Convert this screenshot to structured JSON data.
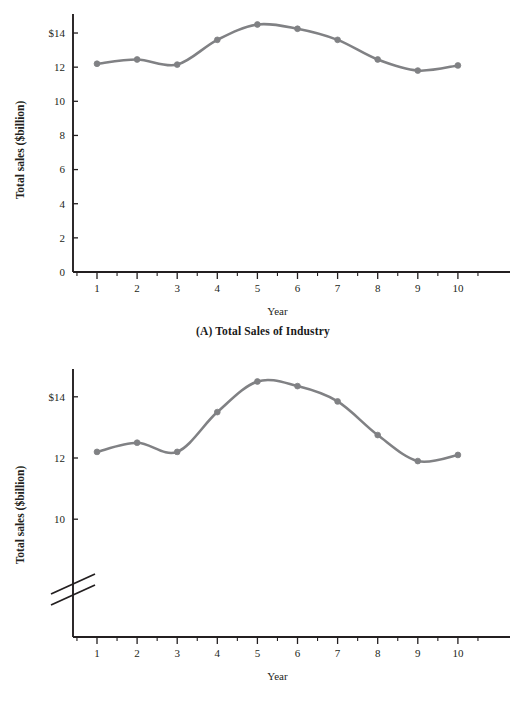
{
  "chart_data": [
    {
      "id": "panel-a",
      "type": "line",
      "title": "(A) Total Sales of Industry",
      "xlabel": "Year",
      "ylabel": "Total sales ($billion)",
      "x": [
        1,
        2,
        3,
        4,
        5,
        6,
        7,
        8,
        9,
        10
      ],
      "categories": [
        "1",
        "2",
        "3",
        "4",
        "5",
        "6",
        "7",
        "8",
        "9",
        "10"
      ],
      "values": [
        12.2,
        12.45,
        12.15,
        13.6,
        14.5,
        14.25,
        13.6,
        12.45,
        11.8,
        12.1
      ],
      "series": [
        {
          "name": "Total sales",
          "values": [
            12.2,
            12.45,
            12.15,
            13.6,
            14.5,
            14.25,
            13.6,
            12.45,
            11.8,
            12.1
          ]
        }
      ],
      "xlim": [
        0,
        11
      ],
      "ylim": [
        0,
        15.1
      ],
      "ytick_values": [
        0,
        2,
        4,
        6,
        8,
        10,
        12,
        14
      ],
      "ytick_labels": [
        "0",
        "2",
        "4",
        "6",
        "8",
        "10",
        "12",
        "$14"
      ],
      "xtick_values": [
        1,
        2,
        3,
        4,
        5,
        6,
        7,
        8,
        9,
        10
      ],
      "xtick_labels": [
        "1",
        "2",
        "3",
        "4",
        "5",
        "6",
        "7",
        "8",
        "9",
        "10"
      ],
      "minor_xticks": true,
      "grid": false,
      "legend": "none",
      "truncated_axis": false,
      "line_color": "#808184",
      "marker": "circle"
    },
    {
      "id": "panel-b",
      "type": "line",
      "title": "(B) Truncated Vertical Axis",
      "xlabel": "Year",
      "ylabel": "Total sales ($billion)",
      "x": [
        1,
        2,
        3,
        4,
        5,
        6,
        7,
        8,
        9,
        10
      ],
      "categories": [
        "1",
        "2",
        "3",
        "4",
        "5",
        "6",
        "7",
        "8",
        "9",
        "10"
      ],
      "values": [
        12.2,
        12.5,
        12.2,
        13.5,
        14.5,
        14.35,
        13.85,
        12.75,
        11.9,
        12.1
      ],
      "series": [
        {
          "name": "Total sales",
          "values": [
            12.2,
            12.5,
            12.2,
            13.5,
            14.5,
            14.35,
            13.85,
            12.75,
            11.9,
            12.1
          ]
        }
      ],
      "xlim": [
        0,
        11
      ],
      "ylim": [
        9.0,
        14.9
      ],
      "ytick_values": [
        10,
        12,
        14
      ],
      "ytick_labels": [
        "10",
        "12",
        "$14"
      ],
      "xtick_values": [
        1,
        2,
        3,
        4,
        5,
        6,
        7,
        8,
        9,
        10
      ],
      "xtick_labels": [
        "1",
        "2",
        "3",
        "4",
        "5",
        "6",
        "7",
        "8",
        "9",
        "10"
      ],
      "minor_xticks": true,
      "grid": false,
      "legend": "none",
      "truncated_axis": true,
      "axis_break_symbol": "double-slash",
      "line_color": "#808184",
      "marker": "circle"
    }
  ],
  "panel_a": {
    "caption": "(A) Total Sales of Industry",
    "xlabel": "Year",
    "ylabel": "Total sales ($billion)",
    "ytick_labels": [
      "$14",
      "12",
      "10",
      "8",
      "6",
      "4",
      "2",
      "0"
    ],
    "xtick_labels": [
      "1",
      "2",
      "3",
      "4",
      "5",
      "6",
      "7",
      "8",
      "9",
      "10"
    ]
  },
  "panel_b": {
    "caption": "(B) Truncated Vertical Axis",
    "xlabel": "Year",
    "ylabel": "Total sales ($billion)",
    "ytick_labels": [
      "$14",
      "12",
      "10"
    ],
    "xtick_labels": [
      "1",
      "2",
      "3",
      "4",
      "5",
      "6",
      "7",
      "8",
      "9",
      "10"
    ]
  },
  "colors": {
    "line": "#808184",
    "axis": "#231f20",
    "text": "#231f20",
    "background": "#ffffff"
  }
}
